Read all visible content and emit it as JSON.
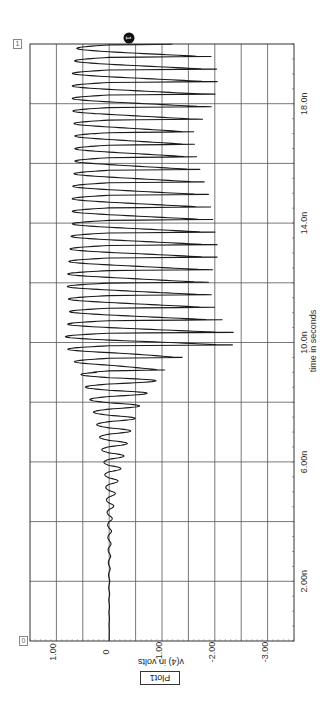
{
  "chart_data": {
    "type": "line",
    "title": "Plot1",
    "orientation": "rotated-90 (time axis vertical, voltage axis horizontal)",
    "xlabel": "time in seconds",
    "ylabel": "v(4) in volts",
    "x_ticks": [
      "2.00n",
      "6.00n",
      "10.0n",
      "14.0n",
      "18.0n"
    ],
    "y_ticks": [
      "1.00",
      "0",
      "-1.00",
      "-2.00",
      "-3.00"
    ],
    "xlim": [
      0,
      2e-08
    ],
    "ylim": [
      -3.5,
      1.5
    ],
    "grid": true,
    "series": [
      {
        "name": "v(4)",
        "description": "Near-zero until ~4ns, growing sinusoidal ringing 5-9ns, then large spiky oscillation from ~9ns to 20ns with positive peaks ~0.5-0.8V and negative spikes to about -1.2 to -2.3V",
        "x_ns": [
          0,
          2,
          4,
          5,
          6,
          7,
          8,
          9,
          9.5,
          10,
          11,
          12,
          13,
          14,
          15,
          16,
          17,
          18,
          19,
          20
        ],
        "pos_peak": [
          0.0,
          0.01,
          0.03,
          0.06,
          0.1,
          0.2,
          0.35,
          0.55,
          0.7,
          0.85,
          0.75,
          0.8,
          0.75,
          0.7,
          0.7,
          0.65,
          0.65,
          0.7,
          0.7,
          0.6
        ],
        "neg_peak": [
          0.0,
          -0.01,
          -0.05,
          -0.12,
          -0.25,
          -0.4,
          -0.6,
          -1.0,
          -1.4,
          -2.55,
          -2.05,
          -1.9,
          -2.1,
          -2.0,
          -1.9,
          -1.7,
          -1.6,
          -2.0,
          -2.1,
          -1.85
        ]
      }
    ],
    "cursors": [
      {
        "id": "1",
        "time_ns": 20.0
      },
      {
        "id": "0",
        "time_ns": 0.0
      }
    ]
  },
  "labels": {
    "plot_title": "Plot1",
    "y_title": "v(4) in volts",
    "x_title": "time in seconds",
    "cursor_top": "1",
    "cursor_bottom": "0",
    "marker": "1"
  },
  "colors": {
    "trace": "#1a1a1a",
    "grid": "#444444",
    "frame": "#333333"
  }
}
